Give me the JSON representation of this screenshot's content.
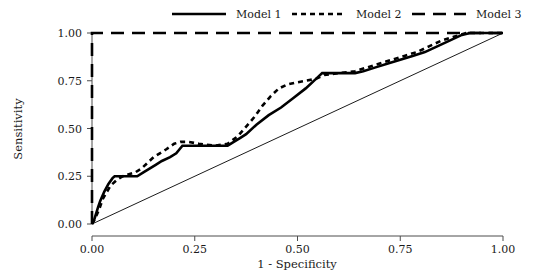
{
  "chart_data": {
    "type": "line",
    "title": "",
    "xlabel": "1 - Specificity",
    "ylabel": "Sensitivity",
    "xlim": [
      0,
      1
    ],
    "ylim": [
      0,
      1
    ],
    "xticks": [
      "0.00",
      "0.25",
      "0.50",
      "0.75",
      "1.00"
    ],
    "yticks": [
      "0.00",
      "0.25",
      "0.50",
      "0.75",
      "1.00"
    ],
    "xtick_values": [
      0,
      0.25,
      0.5,
      0.75,
      1
    ],
    "ytick_values": [
      0,
      0.25,
      0.5,
      0.75,
      1
    ],
    "grid": false,
    "legend_position": "top",
    "reference_line": {
      "name": "chance-diagonal",
      "x": [
        0,
        1
      ],
      "y": [
        0,
        1
      ]
    },
    "series": [
      {
        "name": "Model 1",
        "style": "solid",
        "color": "#000000",
        "x": [
          0.0,
          0.005,
          0.015,
          0.02,
          0.03,
          0.04,
          0.05,
          0.055,
          0.11,
          0.125,
          0.14,
          0.155,
          0.17,
          0.19,
          0.205,
          0.22,
          0.33,
          0.345,
          0.36,
          0.375,
          0.4,
          0.43,
          0.46,
          0.49,
          0.52,
          0.545,
          0.56,
          0.64,
          0.66,
          0.69,
          0.72,
          0.75,
          0.78,
          0.81,
          0.84,
          0.87,
          0.9,
          0.92,
          1.0
        ],
        "y": [
          0.0,
          0.02,
          0.09,
          0.12,
          0.17,
          0.21,
          0.24,
          0.25,
          0.25,
          0.27,
          0.29,
          0.31,
          0.33,
          0.35,
          0.37,
          0.41,
          0.41,
          0.43,
          0.45,
          0.47,
          0.52,
          0.57,
          0.61,
          0.66,
          0.71,
          0.76,
          0.79,
          0.79,
          0.8,
          0.82,
          0.84,
          0.86,
          0.88,
          0.9,
          0.93,
          0.96,
          0.99,
          1.0,
          1.0
        ]
      },
      {
        "name": "Model 2",
        "style": "dotted",
        "color": "#000000",
        "x": [
          0.0,
          0.008,
          0.018,
          0.026,
          0.034,
          0.045,
          0.06,
          0.075,
          0.09,
          0.105,
          0.12,
          0.135,
          0.15,
          0.165,
          0.18,
          0.2,
          0.215,
          0.235,
          0.26,
          0.3,
          0.33,
          0.355,
          0.375,
          0.395,
          0.415,
          0.435,
          0.455,
          0.475,
          0.495,
          0.52,
          0.545,
          0.565,
          0.6,
          0.64,
          0.67,
          0.7,
          0.73,
          0.76,
          0.79,
          0.82,
          0.85,
          0.88,
          0.91,
          1.0
        ],
        "y": [
          0.0,
          0.03,
          0.08,
          0.13,
          0.16,
          0.2,
          0.23,
          0.25,
          0.26,
          0.27,
          0.29,
          0.32,
          0.35,
          0.37,
          0.39,
          0.42,
          0.43,
          0.43,
          0.42,
          0.41,
          0.42,
          0.46,
          0.51,
          0.56,
          0.62,
          0.67,
          0.71,
          0.73,
          0.74,
          0.75,
          0.76,
          0.78,
          0.79,
          0.8,
          0.82,
          0.84,
          0.86,
          0.88,
          0.9,
          0.93,
          0.96,
          0.98,
          1.0,
          1.0
        ]
      },
      {
        "name": "Model 3",
        "style": "dashed",
        "color": "#000000",
        "x": [
          0.0,
          0.0,
          1.0
        ],
        "y": [
          0.0,
          1.0,
          1.0
        ]
      }
    ]
  },
  "legend": {
    "items": [
      {
        "label": "Model 1",
        "style": "solid"
      },
      {
        "label": "Model 2",
        "style": "dotted"
      },
      {
        "label": "Model 3",
        "style": "dashed"
      }
    ]
  }
}
